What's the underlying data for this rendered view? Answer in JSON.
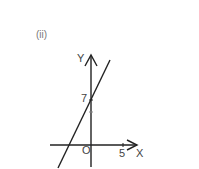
{
  "figure": {
    "part_label": "(ii)",
    "axes": {
      "x_label": "X",
      "y_label": "Y",
      "origin_label": "O",
      "x_tick_label": "5",
      "y_intercept_label": "7"
    },
    "line": {
      "description": "straight line with positive slope crossing Y axis at 7",
      "y_intercept": 7
    },
    "colors": {
      "stroke": "#222222",
      "text": "#444444"
    }
  }
}
